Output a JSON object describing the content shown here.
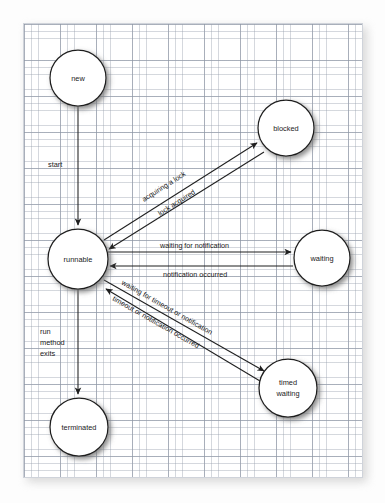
{
  "figure": {
    "medium": "graph paper sheet",
    "colors": {
      "paper": "#ffffff",
      "grid_minor": "#969eac",
      "grid_major": "#7882945",
      "ink": "#1f1f1f",
      "backdrop": "#fdfdfd"
    }
  },
  "states": [
    {
      "id": "new",
      "label": "new",
      "label2": "",
      "cx": 78,
      "cy": 78,
      "r": 28
    },
    {
      "id": "blocked",
      "label": "blocked",
      "label2": "",
      "cx": 286,
      "cy": 128,
      "r": 28
    },
    {
      "id": "runnable",
      "label": "runnable",
      "label2": "",
      "cx": 78,
      "cy": 259,
      "r": 30
    },
    {
      "id": "waiting",
      "label": "waiting",
      "label2": "",
      "cx": 322,
      "cy": 258,
      "r": 28
    },
    {
      "id": "timed-waiting",
      "label": "timed",
      "label2": "waiting",
      "cx": 288,
      "cy": 388,
      "r": 29
    },
    {
      "id": "terminated",
      "label": "terminated",
      "label2": "",
      "cx": 79,
      "cy": 427,
      "r": 29
    }
  ],
  "transitions": [
    {
      "id": "start",
      "from": "new",
      "to": "runnable",
      "label": "start"
    },
    {
      "id": "acquiring-a-lock",
      "from": "runnable",
      "to": "blocked",
      "label": "acquiring a lock"
    },
    {
      "id": "lock-acquired",
      "from": "blocked",
      "to": "runnable",
      "label": "lock acquired"
    },
    {
      "id": "waiting-for-notification",
      "from": "runnable",
      "to": "waiting",
      "label": "waiting for notification"
    },
    {
      "id": "notification-occurred",
      "from": "waiting",
      "to": "runnable",
      "label": "notification occurred"
    },
    {
      "id": "waiting-for-timeout",
      "from": "runnable",
      "to": "timed-waiting",
      "label": "waiting for timeout or notification"
    },
    {
      "id": "timeout-occurred",
      "from": "timed-waiting",
      "to": "runnable",
      "label": "timeout or notification occurred"
    },
    {
      "id": "run-method-exits",
      "from": "runnable",
      "to": "terminated",
      "label": "run method exits",
      "label_lines": [
        "run",
        "method",
        "exits"
      ]
    }
  ],
  "labels": {
    "new": "new",
    "blocked": "blocked",
    "runnable": "runnable",
    "waiting": "waiting",
    "timed": "timed",
    "timed_waiting_2": "waiting",
    "terminated": "terminated",
    "start": "start",
    "acquiring_a_lock": "acquiring a lock",
    "lock_acquired": "lock acquired",
    "waiting_for_notification": "waiting for notification",
    "notification_occurred": "notification occurred",
    "waiting_for_timeout_or_notification": "waiting for timeout or notification",
    "timeout_or_notification_occurred": "timeout or notification occurred",
    "run": "run",
    "method": "method",
    "exits": "exits"
  }
}
